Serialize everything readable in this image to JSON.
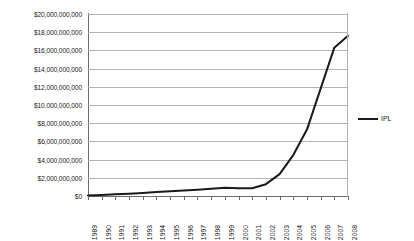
{
  "chart_data": {
    "type": "line",
    "title": "",
    "xlabel": "",
    "ylabel": "",
    "grid": true,
    "legend_position": "right",
    "ylim": [
      0,
      20000000000
    ],
    "ytick_step": 2000000000,
    "ytick_labels": [
      "$20,000,000,000",
      "$18,000,000,000",
      "$16,000,000,000",
      "$14,000,000,000",
      "$12,000,000,000",
      "$10,000,000,000",
      "$8,000,000,000",
      "$6,000,000,000",
      "$4,000,000,000",
      "$2,000,000,000",
      "$0"
    ],
    "ytick_values": [
      20000000000,
      18000000000,
      16000000000,
      14000000000,
      12000000000,
      10000000000,
      8000000000,
      6000000000,
      4000000000,
      2000000000,
      0
    ],
    "categories": [
      "1989",
      "1990",
      "1991",
      "1992",
      "1993",
      "1994",
      "1995",
      "1996",
      "1997",
      "1998",
      "1999",
      "2000",
      "2001",
      "2002",
      "2003",
      "2004",
      "2005",
      "2006",
      "2007",
      "2008"
    ],
    "series": [
      {
        "name": "IPL",
        "color": "#1a1a1a",
        "values": [
          60000000,
          110000000,
          180000000,
          260000000,
          340000000,
          430000000,
          520000000,
          610000000,
          700000000,
          790000000,
          900000000,
          840000000,
          860000000,
          1300000000,
          2400000000,
          4500000000,
          7300000000,
          11800000000,
          16300000000,
          17600000000
        ]
      }
    ]
  },
  "legend": {
    "entries": [
      {
        "label": "IPL",
        "color": "#1a1a1a"
      }
    ]
  }
}
